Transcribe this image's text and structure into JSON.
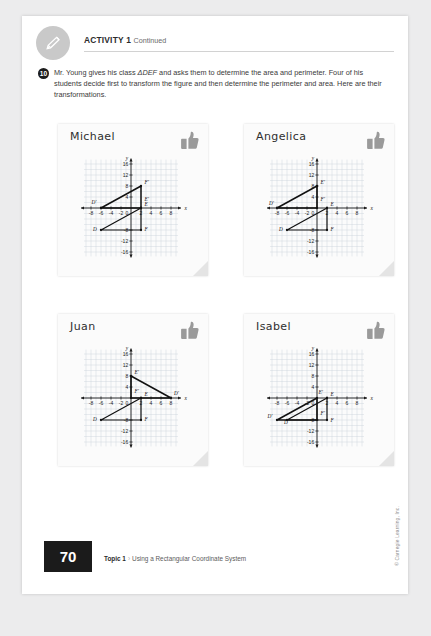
{
  "header": {
    "activity_label": "ACTIVITY 1",
    "continued_label": "Continued",
    "pencil_icon": "pencil-icon"
  },
  "question": {
    "number": "10",
    "text_part1": "Mr. Young gives his class ",
    "text_triangle": "ΔDEF",
    "text_part2": " and asks them to determine the area and perimeter. Four of his students decide first to transform the figure and then determine the perimeter and area. Here are their transformations."
  },
  "cards": [
    {
      "name": "Michael",
      "thumb_icon": "thumbs-up-icon",
      "chart_index": 0
    },
    {
      "name": "Angelica",
      "thumb_icon": "thumbs-up-icon",
      "chart_index": 1
    },
    {
      "name": "Juan",
      "thumb_icon": "thumbs-up-icon",
      "chart_index": 2
    },
    {
      "name": "Isabel",
      "thumb_icon": "thumbs-up-icon",
      "chart_index": 3
    }
  ],
  "chart_data": [
    {
      "type": "scatter",
      "title": "Michael",
      "xlabel": "x",
      "ylabel": "y",
      "xlim": [
        -10,
        10
      ],
      "ylim": [
        -18,
        18
      ],
      "grid": true,
      "xticks": [
        -8,
        -6,
        -4,
        -2,
        0,
        2,
        4,
        6,
        8
      ],
      "yticks": [
        16,
        12,
        8,
        4,
        0,
        -8,
        -12,
        -16
      ],
      "xtick_labels": [
        "-8",
        "-6",
        "-4",
        "-2",
        "0",
        "2",
        "4",
        "6",
        "8"
      ],
      "ytick_labels": [
        "16",
        "12",
        "8",
        "4",
        "0",
        "-8",
        "-12",
        "-16"
      ],
      "series": [
        {
          "name": "preimage",
          "points": [
            [
              -6,
              -8
            ],
            [
              2,
              0
            ],
            [
              2,
              -8
            ]
          ],
          "labels": [
            "D",
            "E",
            "F"
          ],
          "label_positions": [
            [
              -7.6,
              -8.2
            ],
            [
              2.7,
              0.6
            ],
            [
              2.7,
              -8.2
            ]
          ]
        },
        {
          "name": "image",
          "points": [
            [
              -6,
              0
            ],
            [
              2,
              0
            ],
            [
              2,
              8
            ]
          ],
          "labels": [
            "D'",
            "E'",
            "F'"
          ],
          "label_positions": [
            [
              -7.9,
              1.6
            ],
            [
              2.7,
              2.6
            ],
            [
              2.7,
              8.8
            ]
          ]
        }
      ]
    },
    {
      "type": "scatter",
      "title": "Angelica",
      "xlabel": "x",
      "ylabel": "y",
      "xlim": [
        -10,
        10
      ],
      "ylim": [
        -18,
        18
      ],
      "grid": true,
      "xticks": [
        -8,
        -6,
        -4,
        -2,
        0,
        2,
        4,
        6,
        8
      ],
      "yticks": [
        16,
        12,
        8,
        4,
        0,
        -8,
        -12,
        -16
      ],
      "xtick_labels": [
        "-8",
        "-6",
        "-4",
        "-2",
        "0",
        "2",
        "4",
        "6",
        "8"
      ],
      "ytick_labels": [
        "16",
        "12",
        "8",
        "4",
        "0",
        "-8",
        "-12",
        "-16"
      ],
      "series": [
        {
          "name": "preimage",
          "points": [
            [
              -6,
              -8
            ],
            [
              2,
              0
            ],
            [
              2,
              -8
            ]
          ],
          "labels": [
            "D",
            "E",
            "F"
          ],
          "label_positions": [
            [
              -7.6,
              -8.2
            ],
            [
              2.7,
              0.6
            ],
            [
              2.7,
              -8.2
            ]
          ]
        },
        {
          "name": "image",
          "points": [
            [
              -8,
              0
            ],
            [
              0,
              8
            ],
            [
              0,
              0
            ]
          ],
          "labels": [
            "D'",
            "E'",
            "F'"
          ],
          "label_positions": [
            [
              -9.6,
              1.2
            ],
            [
              0.7,
              8.8
            ],
            [
              0.7,
              2.6
            ]
          ]
        }
      ]
    },
    {
      "type": "scatter",
      "title": "Juan",
      "xlabel": "x",
      "ylabel": "y",
      "xlim": [
        -10,
        10
      ],
      "ylim": [
        -18,
        18
      ],
      "grid": true,
      "xticks": [
        -8,
        -6,
        -4,
        -2,
        0,
        2,
        4,
        6,
        8
      ],
      "yticks": [
        16,
        12,
        8,
        4,
        0,
        -8,
        -12,
        -16
      ],
      "xtick_labels": [
        "-8",
        "-6",
        "-4",
        "-2",
        "0",
        "2",
        "4",
        "6",
        "8"
      ],
      "ytick_labels": [
        "16",
        "12",
        "8",
        "4",
        "0",
        "-8",
        "-12",
        "-16"
      ],
      "series": [
        {
          "name": "preimage",
          "points": [
            [
              -6,
              -8
            ],
            [
              2,
              0
            ],
            [
              2,
              -8
            ]
          ],
          "labels": [
            "D",
            "E",
            "F"
          ],
          "label_positions": [
            [
              -7.6,
              -8.2
            ],
            [
              2.7,
              0.6
            ],
            [
              2.7,
              -8.2
            ]
          ]
        },
        {
          "name": "image",
          "points": [
            [
              8,
              0
            ],
            [
              0,
              8
            ],
            [
              0,
              0
            ]
          ],
          "labels": [
            "D'",
            "E'",
            "F'"
          ],
          "label_positions": [
            [
              8.6,
              1.2
            ],
            [
              0.7,
              8.8
            ],
            [
              0.7,
              2.0
            ]
          ]
        }
      ]
    },
    {
      "type": "scatter",
      "title": "Isabel",
      "xlabel": "x",
      "ylabel": "y",
      "xlim": [
        -10,
        10
      ],
      "ylim": [
        -18,
        18
      ],
      "grid": true,
      "xticks": [
        -8,
        -6,
        -4,
        -2,
        0,
        2,
        4,
        6,
        8
      ],
      "yticks": [
        16,
        12,
        8,
        4,
        0,
        -8,
        -12,
        -16
      ],
      "xtick_labels": [
        "-8",
        "-6",
        "-4",
        "-2",
        "0",
        "2",
        "4",
        "6",
        "8"
      ],
      "ytick_labels": [
        "16",
        "12",
        "8",
        "4",
        "0",
        "-8",
        "-12",
        "-16"
      ],
      "series": [
        {
          "name": "preimage",
          "points": [
            [
              -6,
              -8
            ],
            [
              2,
              0
            ],
            [
              2,
              -8
            ]
          ],
          "labels": [
            "D",
            "E",
            "F"
          ],
          "label_positions": [
            [
              -6.6,
              -9.6
            ],
            [
              2.7,
              0.6
            ],
            [
              2.7,
              -8.6
            ]
          ]
        },
        {
          "name": "image",
          "points": [
            [
              -8,
              -8
            ],
            [
              0,
              0
            ],
            [
              0,
              -8
            ]
          ],
          "labels": [
            "D'",
            "E'",
            "F'"
          ],
          "label_positions": [
            [
              -9.9,
              -7.2
            ],
            [
              0.3,
              1.6
            ],
            [
              0.7,
              -6.2
            ]
          ]
        }
      ]
    }
  ],
  "footer": {
    "page_number": "70",
    "topic_label": "Topic 1",
    "chevron": "›",
    "section_label": "Using a Rectangular Coordinate System",
    "copyright": "© Carnegie Learning, Inc."
  },
  "colors": {
    "grid": "#c3cdd6",
    "axis": "#1a1a1a",
    "shape": "#111111",
    "page_box": "#1b1b1b",
    "badge": "#c9c9c9"
  }
}
